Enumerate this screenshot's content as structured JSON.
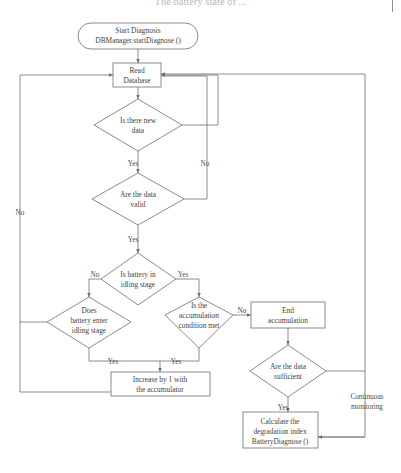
{
  "page": {
    "header_partial_text": "The battery state of ...",
    "background": "#ffffff",
    "line_color": "#6e6e6e",
    "text_color": "#3f3f3f"
  },
  "diagram": {
    "type": "flowchart",
    "nodes": {
      "start": {
        "shape": "terminator",
        "line1": "Start Diagnosis",
        "line2": "DBManager.startDiagnose ()"
      },
      "read_database": {
        "shape": "process",
        "line1": "Read",
        "line2": "Database"
      },
      "is_there_new_data": {
        "shape": "decision",
        "line1": "Is there new",
        "line2": "data"
      },
      "are_the_data_valid": {
        "shape": "decision",
        "line1": "Are the data",
        "line2": "valid"
      },
      "is_battery_idling": {
        "shape": "decision",
        "line1": "Is battery in",
        "line2": "idling stage"
      },
      "does_battery_enter_idling": {
        "shape": "decision",
        "line1": "Does",
        "line2": "battery enter",
        "line3": "idling stage"
      },
      "accumulation_condition": {
        "shape": "decision",
        "line1": "Is the",
        "line2": "accumulation",
        "line3": "condition met"
      },
      "end_accumulation": {
        "shape": "process",
        "line1": "End",
        "line2": "accumulation"
      },
      "are_data_sufficient": {
        "shape": "decision",
        "line1": "Are the data",
        "line2": "sufficient"
      },
      "increase_accumulator": {
        "shape": "process",
        "line1": "Increase by 1 with",
        "line2": "the accumulator"
      },
      "calculate_degradation": {
        "shape": "process",
        "line1": "Calculate the",
        "line2": "degradation index",
        "line3": "BatteryDiagnose ()"
      }
    },
    "edge_labels": {
      "new_data_yes": "Yes",
      "new_data_no": "No",
      "data_valid_yes": "Yes",
      "data_valid_no": "No",
      "idling_no": "No",
      "idling_yes": "Yes",
      "enter_idling_yes": "Yes",
      "accumulation_yes": "Yes",
      "accumulation_no": "No",
      "sufficient_yes": "Yes",
      "continuous_monitoring": "Continuous",
      "continuous_monitoring2": "monitoring"
    }
  }
}
